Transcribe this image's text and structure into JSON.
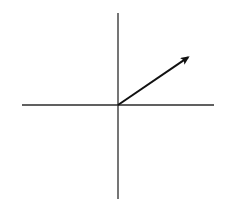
{
  "diagram": {
    "type": "vector-on-axes",
    "background": "#ffffff",
    "axes": {
      "color": "#2b2b2b",
      "origin": [
        118,
        105
      ],
      "horizontal": {
        "x1": 22,
        "x2": 214,
        "y": 105
      },
      "vertical": {
        "x": 118,
        "y1": 13,
        "y2": 199
      }
    },
    "vector": {
      "color": "#111111",
      "from": [
        118,
        105
      ],
      "to": [
        190,
        56
      ],
      "direction": "up-right"
    }
  }
}
